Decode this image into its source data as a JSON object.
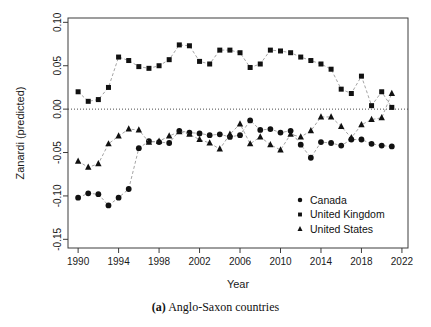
{
  "caption": {
    "prefix": "(a)",
    "text": "Anglo-Saxon countries"
  },
  "chart_data": {
    "type": "scatter",
    "title": "",
    "xlabel": "Year",
    "ylabel": "Zanardi (predicted)",
    "xlim": [
      1989,
      2022.6
    ],
    "ylim": [
      -0.16,
      0.105
    ],
    "xticks": [
      1990,
      1994,
      1998,
      2002,
      2006,
      2010,
      2014,
      2018,
      2022
    ],
    "xtick_labels": [
      "1990",
      "1994",
      "1998",
      "2002",
      "2006",
      "2010",
      "2014",
      "2018",
      "2022"
    ],
    "yticks": [
      0.1,
      0.05,
      0.0,
      -0.05,
      -0.1,
      -0.15
    ],
    "ytick_labels": [
      "0.10",
      "0.05",
      "0.00",
      "-0.05",
      "-0.10",
      "-0.15"
    ],
    "grid": false,
    "zero_reference_line": 0.0,
    "legend_position": "bottom-right",
    "marker_colors": {
      "marker_fill": "#111111",
      "connector_line": "#9a9a9a",
      "axis": "#3c3c3c"
    },
    "series": [
      {
        "name": "Canada",
        "marker": "circle",
        "x": [
          1990,
          1991,
          1992,
          1993,
          1994,
          1995,
          1996,
          1997,
          1998,
          1999,
          2000,
          2001,
          2002,
          2003,
          2004,
          2005,
          2006,
          2007,
          2008,
          2009,
          2010,
          2011,
          2012,
          2013,
          2014,
          2015,
          2016,
          2017,
          2018,
          2019,
          2020,
          2021
        ],
        "values": [
          -0.102,
          -0.097,
          -0.098,
          -0.111,
          -0.102,
          -0.092,
          -0.045,
          -0.037,
          -0.038,
          -0.039,
          -0.025,
          -0.027,
          -0.028,
          -0.03,
          -0.029,
          -0.032,
          -0.03,
          -0.013,
          -0.024,
          -0.023,
          -0.027,
          -0.025,
          -0.041,
          -0.056,
          -0.038,
          -0.039,
          -0.042,
          -0.035,
          -0.035,
          -0.04,
          -0.042,
          -0.043
        ]
      },
      {
        "name": "United Kingdom",
        "marker": "square",
        "x": [
          1990,
          1991,
          1992,
          1993,
          1994,
          1995,
          1996,
          1997,
          1998,
          1999,
          2000,
          2001,
          2002,
          2003,
          2004,
          2005,
          2006,
          2007,
          2008,
          2009,
          2010,
          2011,
          2012,
          2013,
          2014,
          2015,
          2016,
          2017,
          2018,
          2019,
          2020,
          2021
        ],
        "values": [
          0.02,
          0.009,
          0.011,
          0.025,
          0.06,
          0.056,
          0.049,
          0.047,
          0.05,
          0.057,
          0.074,
          0.073,
          0.055,
          0.052,
          0.068,
          0.068,
          0.065,
          0.048,
          0.052,
          0.068,
          0.067,
          0.065,
          0.06,
          0.056,
          0.052,
          0.046,
          0.023,
          0.018,
          0.038,
          0.004,
          0.02,
          0.002
        ]
      },
      {
        "name": "United States",
        "marker": "triangle",
        "x": [
          1990,
          1991,
          1992,
          1993,
          1994,
          1995,
          1996,
          1997,
          1998,
          1999,
          2000,
          2001,
          2002,
          2003,
          2004,
          2005,
          2006,
          2007,
          2008,
          2009,
          2010,
          2011,
          2012,
          2013,
          2014,
          2015,
          2016,
          2017,
          2018,
          2019,
          2020,
          2021
        ],
        "values": [
          -0.06,
          -0.067,
          -0.063,
          -0.04,
          -0.031,
          -0.023,
          -0.024,
          -0.038,
          -0.037,
          -0.031,
          -0.026,
          -0.029,
          -0.035,
          -0.039,
          -0.046,
          -0.029,
          -0.017,
          -0.04,
          -0.032,
          -0.041,
          -0.047,
          -0.029,
          -0.032,
          -0.025,
          -0.009,
          -0.009,
          -0.02,
          -0.033,
          -0.018,
          -0.012,
          -0.01,
          0.018
        ]
      }
    ]
  },
  "legend": {
    "entries": [
      {
        "label": "Canada",
        "marker": "circle"
      },
      {
        "label": "United Kingdom",
        "marker": "square"
      },
      {
        "label": "United States",
        "marker": "triangle"
      }
    ]
  }
}
